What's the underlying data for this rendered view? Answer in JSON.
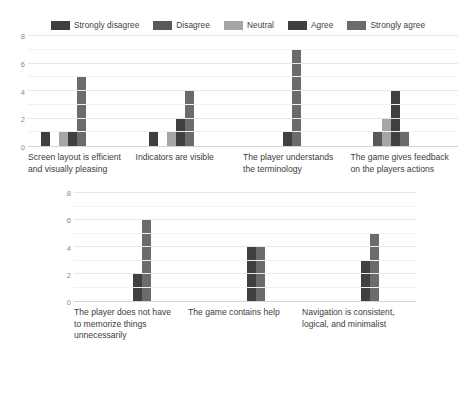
{
  "legend": {
    "position": "top-center",
    "items": [
      {
        "label": "Strongly disagree",
        "color": "#3f3f3f"
      },
      {
        "label": "Disagree",
        "color": "#595959"
      },
      {
        "label": "Neutral",
        "color": "#a6a6a6"
      },
      {
        "label": "Agree",
        "color": "#404040"
      },
      {
        "label": "Strongly agree",
        "color": "#6b6b6b"
      }
    ]
  },
  "chart_data": [
    {
      "type": "bar",
      "title": "",
      "xlabel": "",
      "ylabel": "",
      "ylim": [
        0,
        8
      ],
      "yticks": [
        0,
        2,
        4,
        6,
        8
      ],
      "grid": true,
      "legend_position": "top-center",
      "categories": [
        "Screen layout is efficient and visually pleasing",
        "Indicators are visible",
        "The player understands the terminology",
        "The game gives feedback on the players actions"
      ],
      "series": [
        {
          "name": "Strongly disagree",
          "color": "#3f3f3f",
          "values": [
            1,
            1,
            0,
            0
          ]
        },
        {
          "name": "Disagree",
          "color": "#595959",
          "values": [
            0,
            0,
            0,
            1
          ]
        },
        {
          "name": "Neutral",
          "color": "#a6a6a6",
          "values": [
            1,
            1,
            0,
            2
          ]
        },
        {
          "name": "Agree",
          "color": "#404040",
          "values": [
            1,
            2,
            1,
            4
          ]
        },
        {
          "name": "Strongly agree",
          "color": "#6b6b6b",
          "values": [
            5,
            4,
            7,
            1
          ]
        }
      ]
    },
    {
      "type": "bar",
      "title": "",
      "xlabel": "",
      "ylabel": "",
      "ylim": [
        0,
        8
      ],
      "yticks": [
        0,
        2,
        4,
        6,
        8
      ],
      "grid": true,
      "legend_position": "none",
      "categories": [
        "The player does not have to memorize things unnecessarily",
        "The game contains help",
        "Navigation is consistent, logical, and minimalist"
      ],
      "series": [
        {
          "name": "Strongly disagree",
          "color": "#3f3f3f",
          "values": [
            0,
            0,
            0
          ]
        },
        {
          "name": "Disagree",
          "color": "#595959",
          "values": [
            0,
            0,
            0
          ]
        },
        {
          "name": "Neutral",
          "color": "#a6a6a6",
          "values": [
            0,
            0,
            0
          ]
        },
        {
          "name": "Agree",
          "color": "#404040",
          "values": [
            2,
            4,
            3
          ]
        },
        {
          "name": "Strongly agree",
          "color": "#6b6b6b",
          "values": [
            6,
            4,
            5
          ]
        }
      ]
    }
  ]
}
